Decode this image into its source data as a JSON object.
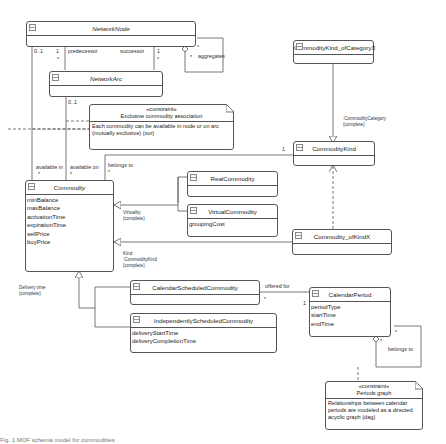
{
  "diagram": {
    "type": "UML class diagram",
    "classes": {
      "network_node": {
        "name": "NetworkNode",
        "italic": true,
        "attributes": []
      },
      "network_arc": {
        "name": "NetworkArc",
        "italic": true,
        "attributes": []
      },
      "commodity_kind_of_category": {
        "name": "CommodityKind_ofCategoryX",
        "italic": false,
        "attributes": []
      },
      "commodity_kind": {
        "name": "CommodityKind",
        "italic": false,
        "attributes": []
      },
      "commodity": {
        "name": "Commodity",
        "italic": true,
        "attributes": [
          "minBalance",
          "maxBalance",
          "activationTime",
          "expirationTime",
          "sellPrice",
          "buyPrice"
        ]
      },
      "real_commodity": {
        "name": "RealCommodity",
        "italic": false,
        "attributes": []
      },
      "virtual_commodity": {
        "name": "VirtualCommodity",
        "italic": false,
        "attributes": [
          "groupingCost"
        ]
      },
      "commodity_of_kind": {
        "name": "Commodity_ofKindX",
        "italic": false,
        "attributes": []
      },
      "calendar_scheduled": {
        "name": "CalendarScheduledCommodity",
        "italic": false,
        "attributes": []
      },
      "independently_scheduled": {
        "name": "IndependentlyScheduledCommodity",
        "italic": false,
        "attributes": [
          "deliveryStartTime",
          "deliveryCompletionTime"
        ]
      },
      "calendar_period": {
        "name": "CalendarPeriod",
        "italic": false,
        "attributes": [
          "periodType",
          "startTime",
          "endTime"
        ]
      }
    },
    "notes": {
      "exclusive": {
        "stereotype": "«constraint»",
        "title": "Exclusive commodity association",
        "body": "Each commodity can be available in node or on arc (mutually exclusive) {xor}"
      },
      "periods": {
        "stereotype": "«constraint»",
        "title": "Periods graph",
        "body": "Relationships between calendar periods are modeled as a directed acyclic graph {dag}"
      }
    },
    "labels": {
      "node_mult_01": "0..1",
      "node_mult_1": "1",
      "node_mult_star1": "*",
      "predecessor": "predecessor",
      "successor": "successor",
      "succ_mult_1": "1",
      "succ_mult_star": "*",
      "agg_star_a": "*",
      "agg_star_b": "*",
      "aggregates": "aggregates",
      "arc_mult_01": "0..1",
      "available_in": "available in",
      "available_in_star": "*",
      "available_on": "available on",
      "available_on_star": "*",
      "belongs_to": "belongs to",
      "belongs_to_star": "*",
      "kind_mult_1": "1",
      "category_gs_1": ":CommodityCategory",
      "category_gs_2": "{complete}",
      "virtuality_1": "Virtuality",
      "virtuality_2": "{complete}",
      "kind_gs_1": "Kind",
      "kind_gs_2": ":CommodityKind",
      "kind_gs_3": "{complete}",
      "delivery_1": "Delivery time",
      "delivery_2": "{complete}",
      "offered_for": "offered for",
      "offered_star": "*",
      "offered_1": "1",
      "period_star_a": "*",
      "period_star_b": "*",
      "period_belongs_to": "belongs to"
    }
  },
  "caption": "Fig. 1 MOF schema model for commodities"
}
